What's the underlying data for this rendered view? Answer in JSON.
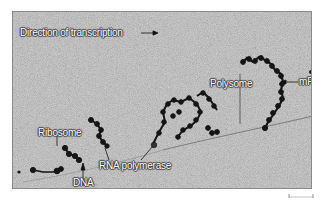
{
  "figure": {
    "type": "electron-micrograph",
    "background_color": "#9a9a9a",
    "strand_color": "#1a1a1a",
    "labels": {
      "direction": "Direction of transcription",
      "mrna": "mRNA",
      "polysome": "Polysome",
      "ribosome": "Ribosome",
      "rna_polymerase": "RNA polymerase",
      "dna": "DNA"
    },
    "scale_bar": {
      "visible": true,
      "label": ""
    }
  }
}
